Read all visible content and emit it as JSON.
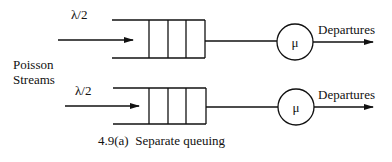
{
  "diagram": {
    "source_label": "Poisson Streams",
    "source_label_lines": [
      "Poisson",
      "Streams"
    ],
    "caption": "4.9(a)  Separate queuing",
    "queues": [
      {
        "arrival_rate": "λ/2",
        "server_rate": "μ",
        "output_label": "Departures",
        "buffer_slots": 3
      },
      {
        "arrival_rate": "λ/2",
        "server_rate": "μ",
        "output_label": "Departures",
        "buffer_slots": 3
      }
    ]
  }
}
